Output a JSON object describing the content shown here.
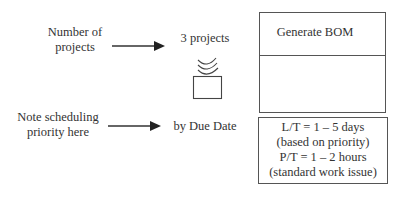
{
  "diagram": {
    "annotations": [
      {
        "id": "number-of-projects",
        "text_lines": [
          "Number of",
          "projects"
        ]
      },
      {
        "id": "scheduling-priority",
        "text_lines": [
          "Note scheduling",
          "priority here"
        ]
      }
    ],
    "values": {
      "project_count": "3 projects",
      "priority": "by Due Date"
    },
    "process_box": {
      "title": "Generate BOM"
    },
    "data_box": {
      "lines": [
        "L/T = 1 – 5 days",
        "(based on priority)",
        "P/T = 1 – 2 hours",
        "(standard work issue)"
      ]
    },
    "icons": {
      "inventory": "inbox-queue-icon",
      "arrow": "arrow-right-icon"
    },
    "colors": {
      "line": "#555555",
      "text": "#333333",
      "background": "#ffffff"
    }
  }
}
